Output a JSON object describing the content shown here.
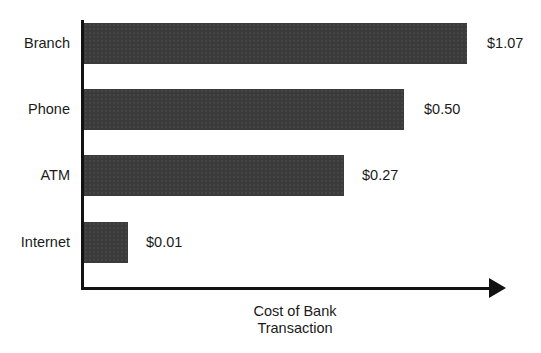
{
  "chart_data": {
    "type": "bar",
    "orientation": "horizontal",
    "title": "",
    "subtitle": "",
    "xlabel": "Cost of Bank Transaction",
    "xlabel_lines": [
      "Cost of Bank",
      "Transaction"
    ],
    "ylabel": "",
    "categories": [
      "Branch",
      "Phone",
      "ATM",
      "Internet"
    ],
    "values": [
      1.07,
      0.5,
      0.27,
      0.01
    ],
    "value_labels": [
      "$1.07",
      "$0.50",
      "$0.27",
      "$0.01"
    ],
    "bar_color": "#3b3b3b",
    "axis_color": "#121212",
    "background": "#ffffff",
    "grid": false,
    "legend": false,
    "axis_ticks": false,
    "axis_has_arrow": true,
    "note": "Bar lengths are schematic and not strictly proportional to the dollar values",
    "bars": [
      {
        "category": "Branch",
        "value": 1.07,
        "label": "$1.07",
        "bar_px": {
          "x": 84,
          "y": 23,
          "w": 383,
          "h": 41
        },
        "label_x": 487,
        "label_y": 44,
        "cat_y": 44
      },
      {
        "category": "Phone",
        "value": 0.5,
        "label": "$0.50",
        "bar_px": {
          "x": 84,
          "y": 89,
          "w": 320,
          "h": 41
        },
        "label_x": 424,
        "label_y": 110,
        "cat_y": 110
      },
      {
        "category": "ATM",
        "value": 0.27,
        "label": "$0.27",
        "bar_px": {
          "x": 84,
          "y": 155,
          "w": 260,
          "h": 41
        },
        "label_x": 362,
        "label_y": 176,
        "cat_y": 176
      },
      {
        "category": "Internet",
        "value": 0.01,
        "label": "$0.01",
        "bar_px": {
          "x": 84,
          "y": 222,
          "w": 44,
          "h": 41
        },
        "label_x": 146,
        "label_y": 243,
        "cat_y": 243
      }
    ]
  }
}
